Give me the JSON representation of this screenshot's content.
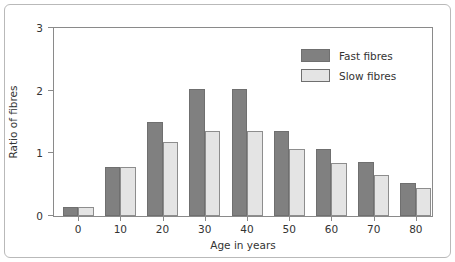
{
  "chart_data": {
    "type": "bar",
    "title": "",
    "xlabel": "Age in years",
    "ylabel": "Ratio of fibres",
    "categories": [
      "0",
      "10",
      "20",
      "30",
      "40",
      "50",
      "60",
      "70",
      "80"
    ],
    "series": [
      {
        "name": "Fast fibres",
        "color": "#808080",
        "values": [
          0.15,
          0.78,
          1.48,
          2.0,
          2.0,
          1.35,
          1.06,
          0.86,
          0.52
        ]
      },
      {
        "name": "Slow fibres",
        "color": "#e4e4e4",
        "values": [
          0.15,
          0.78,
          1.17,
          1.35,
          1.35,
          1.06,
          0.84,
          0.64,
          0.45
        ]
      }
    ],
    "ylim": [
      0,
      3
    ],
    "yticks": [
      "0",
      "1",
      "2",
      "3"
    ],
    "xticks": [
      "0",
      "10",
      "20",
      "30",
      "40",
      "50",
      "60",
      "70",
      "80"
    ],
    "grid": false,
    "legend_position": "top-right"
  },
  "legend": {
    "entries": [
      {
        "label": "Fast fibres",
        "color": "#808080"
      },
      {
        "label": "Slow fibres",
        "color": "#e4e4e4"
      }
    ]
  },
  "axes": {
    "y_title": "Ratio of fibres",
    "x_title": "Age in years"
  }
}
